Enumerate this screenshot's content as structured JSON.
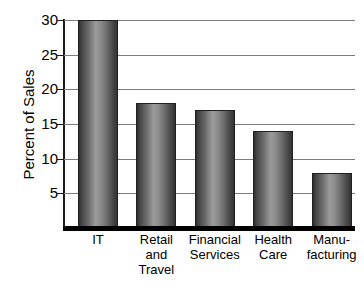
{
  "chart_data": {
    "type": "bar",
    "title": "",
    "xlabel": "",
    "ylabel": "Percent of Sales",
    "categories": [
      "IT",
      "Retail and Travel",
      "Financial Services",
      "Health Care",
      "Manufacturing"
    ],
    "category_lines": [
      [
        "IT"
      ],
      [
        "Retail",
        "and",
        "Travel"
      ],
      [
        "Financial",
        "Services"
      ],
      [
        "Health",
        "Care"
      ],
      [
        "Manu-",
        "facturing"
      ]
    ],
    "values": [
      30,
      18,
      17,
      14,
      8
    ],
    "ylim": [
      0,
      30
    ],
    "yticks": [
      5,
      10,
      15,
      20,
      25,
      30
    ],
    "ytick_labels": [
      "5",
      "10",
      "15",
      "20",
      "25",
      "30"
    ],
    "grid": true,
    "grid_axis": "y",
    "legend": "none",
    "bar_fill": "#6e6e6e",
    "bar_edge": "#202020",
    "gridline_color": "#7d7d7d",
    "axis_color": "#000000",
    "background": "#ffffff"
  }
}
